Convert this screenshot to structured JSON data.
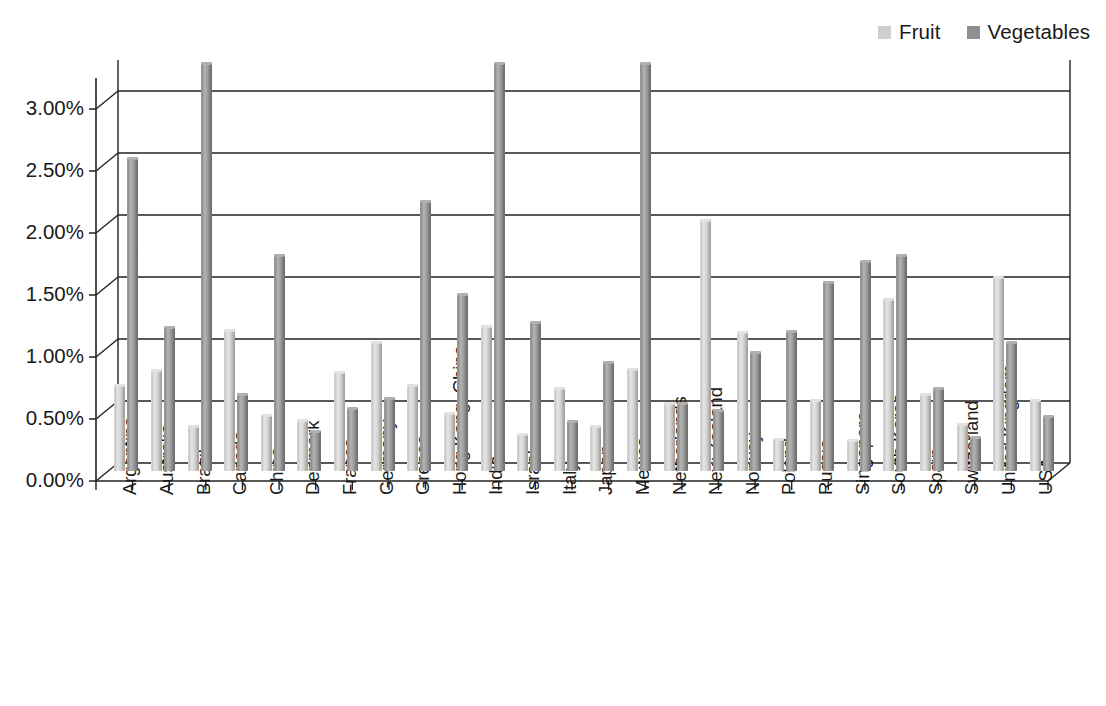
{
  "legend": {
    "position": "top-right",
    "entries": [
      {
        "label": "Fruit",
        "color": "#cfcfcf",
        "name": "legend-item-fruit"
      },
      {
        "label": "Vegetables",
        "color": "#8f8f8f",
        "name": "legend-item-vegetables"
      }
    ]
  },
  "chart_data": {
    "type": "bar",
    "title": "",
    "subtitle": "",
    "xlabel": "",
    "ylabel": "",
    "ylim": [
      0,
      3.25
    ],
    "ytick_values": [
      0,
      0.5,
      1.0,
      1.5,
      2.0,
      2.5,
      3.0
    ],
    "ytick_labels": [
      "0.00%",
      "0.50%",
      "1.00%",
      "1.50%",
      "2.00%",
      "2.50%",
      "3.00%"
    ],
    "grid": true,
    "grid_axis": "y",
    "legend_position": "top-right",
    "value_unit": "%",
    "categories": [
      "Argentina",
      "Australia",
      "Brazil",
      "Canada",
      "China",
      "Denmark",
      "France",
      "Germany",
      "Greece",
      "Hong Kong, China",
      "India",
      "Israel",
      "Italy",
      "Japan",
      "Mexico",
      "Netherlands",
      "New Zealand",
      "Norway",
      "Poland",
      "Russia",
      "Singapore",
      "South Korea",
      "Spain",
      "Switzerland",
      "United Kingdom",
      "USA"
    ],
    "series": [
      {
        "name": "Fruit",
        "color": "#cfcfcf",
        "values": [
          0.7,
          0.82,
          0.37,
          1.15,
          0.46,
          0.42,
          0.81,
          1.05,
          0.7,
          0.48,
          1.18,
          0.31,
          0.68,
          0.37,
          0.83,
          0.56,
          2.03,
          1.13,
          0.27,
          0.58,
          0.26,
          1.4,
          0.63,
          0.39,
          1.57,
          0.58
        ]
      },
      {
        "name": "Vegetables",
        "color": "#8f8f8f",
        "values": [
          2.53,
          1.17,
          3.3,
          0.63,
          1.75,
          0.33,
          0.52,
          0.6,
          2.19,
          1.44,
          3.3,
          1.21,
          0.41,
          0.89,
          3.3,
          0.56,
          0.5,
          0.97,
          1.14,
          1.53,
          1.7,
          1.75,
          0.68,
          0.28,
          1.05,
          0.45
        ]
      }
    ],
    "clipped_note": "Brazil, India and Mexico Vegetables bars extend beyond the top of the plot area"
  }
}
